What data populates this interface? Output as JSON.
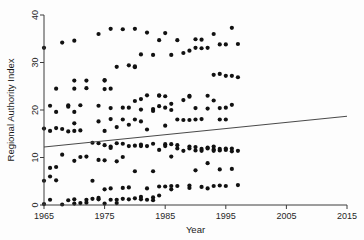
{
  "chart_data": {
    "type": "scatter",
    "title": "",
    "xlabel": "Year",
    "ylabel": "Regional Authority Index",
    "xlim": [
      1965,
      2015
    ],
    "ylim": [
      0,
      40
    ],
    "xticks": [
      1965,
      1975,
      1985,
      1995,
      2005,
      2015
    ],
    "xtick_labels": [
      "1965",
      "1975",
      "1985",
      "1995",
      "2005",
      "2015"
    ],
    "yticks": [
      0,
      10,
      20,
      30,
      40
    ],
    "ytick_labels": [
      "0",
      "10",
      "20",
      "30",
      "40"
    ],
    "grid": false,
    "legend": "none",
    "marker": "filled-circle",
    "marker_color": "#111111",
    "trendline": {
      "type": "linear-fit",
      "color": "#4a4a4a",
      "x_start": 1965,
      "y_start": 12.2,
      "x_end": 2015,
      "y_end": 18.7
    },
    "points": [
      [
        1965,
        33.1
      ],
      [
        1965,
        16.1
      ],
      [
        1965,
        5.1
      ],
      [
        1965,
        0.2
      ],
      [
        1966,
        20.9
      ],
      [
        1966,
        15.6
      ],
      [
        1966,
        7.8
      ],
      [
        1966,
        6.0
      ],
      [
        1966,
        1.1
      ],
      [
        1967,
        24.5
      ],
      [
        1967,
        19.6
      ],
      [
        1967,
        16.2
      ],
      [
        1967,
        8.0
      ],
      [
        1967,
        5.2
      ],
      [
        1968,
        34.2
      ],
      [
        1968,
        16.0
      ],
      [
        1968,
        10.6
      ],
      [
        1968,
        0.1
      ],
      [
        1969,
        21.0
      ],
      [
        1969,
        20.7
      ],
      [
        1969,
        15.5
      ],
      [
        1969,
        1.0
      ],
      [
        1970,
        34.6
      ],
      [
        1970,
        26.2
      ],
      [
        1970,
        24.5
      ],
      [
        1970,
        19.6
      ],
      [
        1970,
        17.2
      ],
      [
        1970,
        15.6
      ],
      [
        1970,
        9.3
      ],
      [
        1970,
        1.2
      ],
      [
        1970,
        0.3
      ],
      [
        1971,
        21.0
      ],
      [
        1971,
        15.7
      ],
      [
        1971,
        10.1
      ],
      [
        1971,
        0.4
      ],
      [
        1972,
        26.2
      ],
      [
        1972,
        24.6
      ],
      [
        1972,
        10.2
      ],
      [
        1972,
        1.1
      ],
      [
        1972,
        0.5
      ],
      [
        1973,
        13.1
      ],
      [
        1973,
        5.1
      ],
      [
        1973,
        1.3
      ],
      [
        1974,
        36.0
      ],
      [
        1974,
        20.9
      ],
      [
        1974,
        17.6
      ],
      [
        1974,
        13.0
      ],
      [
        1974,
        9.5
      ],
      [
        1974,
        1.5
      ],
      [
        1974,
        1.2
      ],
      [
        1975,
        26.3
      ],
      [
        1975,
        26.2
      ],
      [
        1975,
        24.4
      ],
      [
        1975,
        15.6
      ],
      [
        1975,
        12.6
      ],
      [
        1975,
        9.4
      ],
      [
        1975,
        3.3
      ],
      [
        1975,
        0.3
      ],
      [
        1976,
        37.1
      ],
      [
        1976,
        24.5
      ],
      [
        1976,
        20.4
      ],
      [
        1976,
        18.1
      ],
      [
        1976,
        12.3
      ],
      [
        1976,
        12.0
      ],
      [
        1976,
        3.5
      ],
      [
        1976,
        1.1
      ],
      [
        1977,
        29.1
      ],
      [
        1977,
        16.4
      ],
      [
        1977,
        13.0
      ],
      [
        1977,
        9.2
      ],
      [
        1977,
        1.1
      ],
      [
        1977,
        0.4
      ],
      [
        1978,
        37.0
      ],
      [
        1978,
        20.5
      ],
      [
        1978,
        18.0
      ],
      [
        1978,
        12.9
      ],
      [
        1978,
        10.1
      ],
      [
        1978,
        3.6
      ],
      [
        1978,
        1.3
      ],
      [
        1979,
        29.4
      ],
      [
        1979,
        20.5
      ],
      [
        1979,
        16.9
      ],
      [
        1979,
        12.4
      ],
      [
        1979,
        3.7
      ],
      [
        1979,
        1.2
      ],
      [
        1980,
        37.1
      ],
      [
        1980,
        29.0
      ],
      [
        1980,
        29.2
      ],
      [
        1980,
        21.9
      ],
      [
        1980,
        18.0
      ],
      [
        1980,
        12.5
      ],
      [
        1980,
        7.1
      ],
      [
        1980,
        1.4
      ],
      [
        1981,
        31.7
      ],
      [
        1981,
        22.3
      ],
      [
        1981,
        20.1
      ],
      [
        1981,
        17.6
      ],
      [
        1981,
        12.7
      ],
      [
        1981,
        12.4
      ],
      [
        1981,
        1.7
      ],
      [
        1981,
        1.2
      ],
      [
        1982,
        36.3
      ],
      [
        1982,
        23.1
      ],
      [
        1982,
        15.9
      ],
      [
        1982,
        12.4
      ],
      [
        1982,
        3.5
      ],
      [
        1982,
        1.1
      ],
      [
        1983,
        31.6
      ],
      [
        1983,
        20.2
      ],
      [
        1983,
        19.8
      ],
      [
        1983,
        12.9
      ],
      [
        1983,
        7.1
      ],
      [
        1983,
        1.6
      ],
      [
        1983,
        1.0
      ],
      [
        1984,
        34.7
      ],
      [
        1984,
        23.1
      ],
      [
        1984,
        23.0
      ],
      [
        1984,
        20.8
      ],
      [
        1984,
        11.6
      ],
      [
        1984,
        3.9
      ],
      [
        1984,
        2.0
      ],
      [
        1985,
        36.2
      ],
      [
        1985,
        22.9
      ],
      [
        1985,
        20.5
      ],
      [
        1985,
        16.7
      ],
      [
        1985,
        12.8
      ],
      [
        1985,
        12.4
      ],
      [
        1985,
        3.9
      ],
      [
        1986,
        31.6
      ],
      [
        1986,
        21.3
      ],
      [
        1986,
        20.0
      ],
      [
        1986,
        12.8
      ],
      [
        1986,
        10.2
      ],
      [
        1986,
        4.0
      ],
      [
        1986,
        3.3
      ],
      [
        1987,
        34.7
      ],
      [
        1987,
        18.0
      ],
      [
        1987,
        12.6
      ],
      [
        1987,
        11.9
      ],
      [
        1987,
        4.0
      ],
      [
        1988,
        32.0
      ],
      [
        1988,
        22.1
      ],
      [
        1988,
        17.9
      ],
      [
        1988,
        11.4
      ],
      [
        1989,
        32.5
      ],
      [
        1989,
        23.0
      ],
      [
        1989,
        22.8
      ],
      [
        1989,
        17.9
      ],
      [
        1989,
        12.3
      ],
      [
        1989,
        11.9
      ],
      [
        1989,
        4.1
      ],
      [
        1989,
        3.6
      ],
      [
        1990,
        34.9
      ],
      [
        1990,
        33.1
      ],
      [
        1990,
        20.4
      ],
      [
        1990,
        18.0
      ],
      [
        1990,
        11.5
      ],
      [
        1990,
        12.2
      ],
      [
        1990,
        7.3
      ],
      [
        1991,
        34.8
      ],
      [
        1991,
        33.0
      ],
      [
        1991,
        18.1
      ],
      [
        1991,
        11.8
      ],
      [
        1991,
        11.4
      ],
      [
        1991,
        3.8
      ],
      [
        1992,
        33.1
      ],
      [
        1992,
        23.0
      ],
      [
        1992,
        20.3
      ],
      [
        1992,
        12.1
      ],
      [
        1992,
        11.9
      ],
      [
        1992,
        8.8
      ],
      [
        1992,
        3.5
      ],
      [
        1993,
        36.0
      ],
      [
        1993,
        27.4
      ],
      [
        1993,
        22.0
      ],
      [
        1993,
        12.3
      ],
      [
        1993,
        11.7
      ],
      [
        1993,
        11.4
      ],
      [
        1993,
        4.0
      ],
      [
        1994,
        33.8
      ],
      [
        1994,
        27.6
      ],
      [
        1994,
        20.4
      ],
      [
        1994,
        18.0
      ],
      [
        1994,
        11.8
      ],
      [
        1994,
        11.5
      ],
      [
        1994,
        7.5
      ],
      [
        1994,
        4.1
      ],
      [
        1995,
        33.8
      ],
      [
        1995,
        27.2
      ],
      [
        1995,
        20.5
      ],
      [
        1995,
        18.0
      ],
      [
        1995,
        11.6
      ],
      [
        1995,
        11.9
      ],
      [
        1995,
        4.0
      ],
      [
        1996,
        37.3
      ],
      [
        1996,
        27.2
      ],
      [
        1996,
        21.1
      ],
      [
        1996,
        11.9
      ],
      [
        1996,
        11.3
      ],
      [
        1996,
        7.6
      ],
      [
        1997,
        33.9
      ],
      [
        1997,
        26.9
      ],
      [
        1997,
        11.4
      ],
      [
        1997,
        4.2
      ]
    ]
  },
  "axes": {
    "y_title": "Regional Authority Index",
    "x_title": "Year"
  }
}
